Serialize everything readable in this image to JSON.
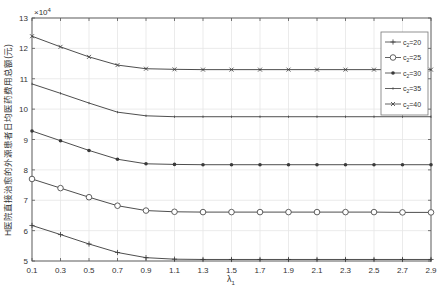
{
  "chart_data": {
    "type": "line",
    "title": "",
    "xlabel": "λ1",
    "xlabel_main": "λ",
    "xlabel_sub": "1",
    "ylabel": "H医院直接治愈的外源患者日均医药费用总额(元)",
    "y_multiplier": "×10",
    "y_multiplier_exp": "4",
    "xlim": [
      0.1,
      2.9
    ],
    "ylim": [
      5,
      13
    ],
    "grid": true,
    "legend_position": "upper right",
    "x": [
      0.1,
      0.3,
      0.5,
      0.7,
      0.9,
      1.1,
      1.3,
      1.5,
      1.7,
      1.9,
      2.1,
      2.3,
      2.5,
      2.7,
      2.9
    ],
    "x_tick_labels": [
      "0.1",
      "0.3",
      "0.5",
      "0.7",
      "0.9",
      "1.1",
      "1.3",
      "1.5",
      "1.7",
      "1.9",
      "2.1",
      "2.3",
      "2.5",
      "2.7",
      "2.9"
    ],
    "y_ticks": [
      5,
      6,
      7,
      8,
      9,
      10,
      11,
      12,
      13
    ],
    "y_tick_labels": [
      "5",
      "6",
      "7",
      "8",
      "9",
      "10",
      "11",
      "12",
      "13"
    ],
    "series": [
      {
        "name": "c2=20",
        "label_main": "c",
        "label_sub": "2",
        "label_rest": "=20",
        "marker": "plus",
        "values": [
          6.17,
          5.87,
          5.56,
          5.28,
          5.11,
          5.06,
          5.05,
          5.05,
          5.05,
          5.05,
          5.05,
          5.05,
          5.05,
          5.05,
          5.05
        ]
      },
      {
        "name": "c2=25",
        "label_main": "c",
        "label_sub": "2",
        "label_rest": "=25",
        "marker": "circle",
        "values": [
          7.7,
          7.4,
          7.1,
          6.82,
          6.66,
          6.62,
          6.61,
          6.61,
          6.61,
          6.61,
          6.61,
          6.61,
          6.61,
          6.6,
          6.6
        ]
      },
      {
        "name": "c2=30",
        "label_main": "c",
        "label_sub": "2",
        "label_rest": "=30",
        "marker": "dot",
        "values": [
          9.28,
          8.96,
          8.64,
          8.35,
          8.2,
          8.18,
          8.17,
          8.17,
          8.17,
          8.17,
          8.17,
          8.17,
          8.17,
          8.17,
          8.17
        ]
      },
      {
        "name": "c2=35",
        "label_main": "c",
        "label_sub": "2",
        "label_rest": "=35",
        "marker": "tick",
        "values": [
          10.83,
          10.52,
          10.2,
          9.9,
          9.78,
          9.75,
          9.75,
          9.75,
          9.75,
          9.75,
          9.75,
          9.75,
          9.75,
          9.75,
          9.75
        ]
      },
      {
        "name": "c2=40",
        "label_main": "c",
        "label_sub": "2",
        "label_rest": "=40",
        "marker": "x",
        "values": [
          12.4,
          12.05,
          11.72,
          11.45,
          11.33,
          11.31,
          11.3,
          11.3,
          11.3,
          11.3,
          11.3,
          11.3,
          11.3,
          11.3,
          11.3
        ]
      }
    ]
  },
  "colors": {
    "line": "#3a3a3a",
    "axis": "#555555",
    "grid": "#e6e6e6",
    "background": "#ffffff"
  }
}
